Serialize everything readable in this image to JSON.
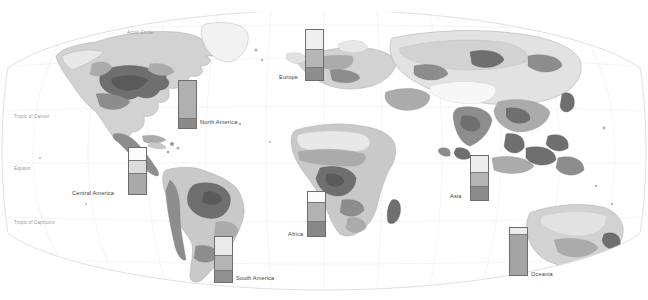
{
  "banner": {
    "title": "urbanisation and farming"
  },
  "map": {
    "projection": "winkel-tripel",
    "ocean_color": "#ffffff",
    "graticule_color": "#e8e8e8",
    "coast_color": "#a8a8a8",
    "border_color": "#c4c4c4",
    "land_palette": [
      "#f7f7f7",
      "#e2e2e2",
      "#c9c9c9",
      "#ababab",
      "#8d8d8d",
      "#6f6f6f"
    ],
    "graticule_labels": [
      {
        "text": "Arctic Circle",
        "x": 127,
        "y": 22
      },
      {
        "text": "Tropic of Cancer",
        "x": 14,
        "y": 111
      },
      {
        "text": "Equator",
        "x": 14,
        "y": 163
      },
      {
        "text": "Tropic of Capricorn",
        "x": 14,
        "y": 217
      }
    ]
  },
  "chart_data": {
    "type": "bar",
    "title": "urbanisation and farming",
    "subtype": "stacked-column",
    "categories": [
      "North America",
      "Europe",
      "Central America",
      "Africa",
      "South America",
      "Asia",
      "Oceania"
    ],
    "series": [
      {
        "name": "light",
        "color": "#e8e8e8"
      },
      {
        "name": "medium",
        "color": "#b4b4b4"
      },
      {
        "name": "dark",
        "color": "#8a8a8a"
      }
    ],
    "bars": [
      {
        "label": "North America",
        "x": 178,
        "y": 72,
        "width": 19,
        "height": 49,
        "label_x": 200,
        "label_y": 111,
        "segments": [
          {
            "name": "medium",
            "color": "#b0b0b0",
            "pct": 78
          },
          {
            "name": "dark",
            "color": "#8a8a8a",
            "pct": 22
          }
        ]
      },
      {
        "label": "Europe",
        "x": 305,
        "y": 21,
        "width": 19,
        "height": 52,
        "label_x": 279,
        "label_y": 66,
        "segments": [
          {
            "name": "light",
            "color": "#efefef",
            "pct": 38
          },
          {
            "name": "medium",
            "color": "#b6b6b6",
            "pct": 36
          },
          {
            "name": "dark",
            "color": "#8e8e8e",
            "pct": 26
          }
        ]
      },
      {
        "label": "Central America",
        "x": 128,
        "y": 139,
        "width": 19,
        "height": 48,
        "label_x": 72,
        "label_y": 182,
        "segments": [
          {
            "name": "white",
            "color": "#fbfbfb",
            "pct": 27
          },
          {
            "name": "light",
            "color": "#dcdcdc",
            "pct": 27
          },
          {
            "name": "medium",
            "color": "#a9a9a9",
            "pct": 46
          }
        ]
      },
      {
        "label": "Africa",
        "x": 307,
        "y": 183,
        "width": 19,
        "height": 46,
        "label_x": 288,
        "label_y": 223,
        "segments": [
          {
            "name": "white",
            "color": "#fbfbfb",
            "pct": 22
          },
          {
            "name": "medium",
            "color": "#b2b2b2",
            "pct": 45
          },
          {
            "name": "dark",
            "color": "#878787",
            "pct": 33
          }
        ]
      },
      {
        "label": "South America",
        "x": 214,
        "y": 228,
        "width": 19,
        "height": 47,
        "label_x": 236,
        "label_y": 267,
        "segments": [
          {
            "name": "light",
            "color": "#eaeaea",
            "pct": 40
          },
          {
            "name": "medium",
            "color": "#b4b4b4",
            "pct": 34
          },
          {
            "name": "dark",
            "color": "#909090",
            "pct": 26
          }
        ]
      },
      {
        "label": "Asia",
        "x": 470,
        "y": 147,
        "width": 19,
        "height": 46,
        "label_x": 450,
        "label_y": 185,
        "segments": [
          {
            "name": "light",
            "color": "#ededed",
            "pct": 36
          },
          {
            "name": "medium",
            "color": "#b4b4b4",
            "pct": 32
          },
          {
            "name": "dark",
            "color": "#8b8b8b",
            "pct": 32
          }
        ]
      },
      {
        "label": "Oceania",
        "x": 509,
        "y": 219,
        "width": 19,
        "height": 49,
        "label_x": 531,
        "label_y": 263,
        "segments": [
          {
            "name": "light",
            "color": "#ececec",
            "pct": 13
          },
          {
            "name": "medium",
            "color": "#a4a4a4",
            "pct": 87
          }
        ]
      }
    ]
  }
}
